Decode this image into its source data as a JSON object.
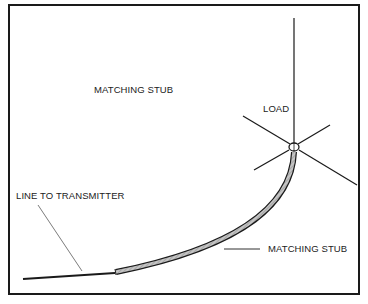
{
  "diagram": {
    "title": "MATCHING STUB",
    "labels": {
      "load": "LOAD",
      "line_to_transmitter": "LINE TO TRANSMITTER",
      "matching_stub": "MATCHING STUB"
    },
    "colors": {
      "line": "#1a1a1a",
      "stub_fill": "#b8b8b8",
      "background": "#ffffff"
    }
  }
}
